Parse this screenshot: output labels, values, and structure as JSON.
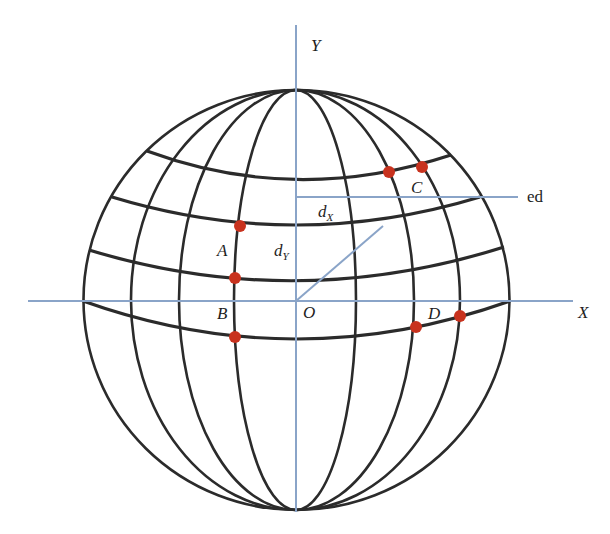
{
  "figure": {
    "colors": {
      "grid": "#2b2b2b",
      "axis": "#8aa4c8",
      "point": "#c8321e",
      "background": "#ffffff"
    },
    "axes": {
      "x_label": "X",
      "y_label": "Y",
      "origin_label": "O"
    },
    "annotations": {
      "ed_label": "ed",
      "dx_main": "d",
      "dx_sub": "X",
      "dy_main": "d",
      "dy_sub": "Y"
    },
    "point_labels": {
      "A": "A",
      "B": "B",
      "C": "C",
      "D": "D"
    },
    "points": [
      {
        "id": "A-top",
        "x": 240,
        "y": 226
      },
      {
        "id": "A-bottom",
        "x": 235,
        "y": 278
      },
      {
        "id": "B-bottom",
        "x": 235,
        "y": 337
      },
      {
        "id": "C-left",
        "x": 389,
        "y": 172
      },
      {
        "id": "C-right",
        "x": 422,
        "y": 167
      },
      {
        "id": "D-left",
        "x": 416,
        "y": 327
      },
      {
        "id": "D-right",
        "x": 460,
        "y": 316
      }
    ]
  }
}
